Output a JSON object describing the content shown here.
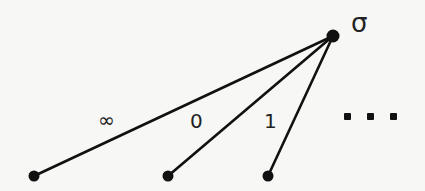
{
  "diagram": {
    "type": "tree",
    "root": {
      "id": "root",
      "label": "σ",
      "x": 333,
      "y": 36
    },
    "children": [
      {
        "id": "child-infinity",
        "x": 34,
        "y": 176,
        "edge_label": "∞"
      },
      {
        "id": "child-0",
        "x": 168,
        "y": 176,
        "edge_label": "0"
      },
      {
        "id": "child-1",
        "x": 268,
        "y": 176,
        "edge_label": "1"
      }
    ],
    "continuation": "…",
    "colors": {
      "line": "#111111",
      "background": "#f7f7f5"
    }
  }
}
